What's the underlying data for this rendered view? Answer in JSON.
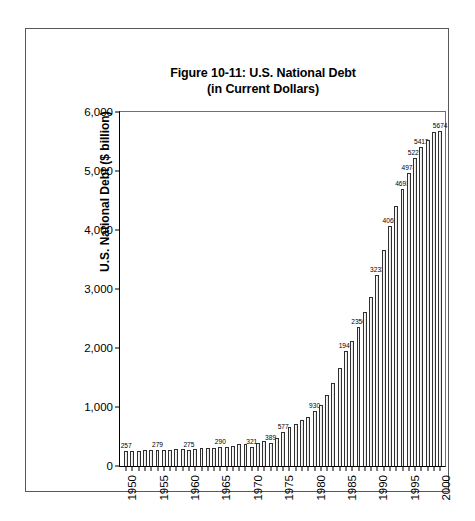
{
  "figure": {
    "title_line1": "Figure 10-11: U.S. National Debt",
    "title_line2": "(in Current Dollars)"
  },
  "chart_data": {
    "type": "bar",
    "title": "Figure 10-11: U.S. National Debt (in Current Dollars)",
    "xlabel": "",
    "ylabel": "U.S. National Debt ($ billion)",
    "ylim": [
      0,
      6000
    ],
    "y_ticks": [
      "0",
      "1,000",
      "2,000",
      "3,000",
      "4,000",
      "5,000",
      "6,000"
    ],
    "y_tick_values": [
      0,
      1000,
      2000,
      3000,
      4000,
      5000,
      6000
    ],
    "x_tick_labels": [
      "1950",
      "1955",
      "1960",
      "1965",
      "1970",
      "1975",
      "1980",
      "1985",
      "1990",
      "1995",
      "2000"
    ],
    "grid": false,
    "legend": false,
    "categories": [
      "1950",
      "1951",
      "1952",
      "1953",
      "1954",
      "1955",
      "1956",
      "1957",
      "1958",
      "1959",
      "1960",
      "1961",
      "1962",
      "1963",
      "1964",
      "1965",
      "1966",
      "1967",
      "1968",
      "1969",
      "1970",
      "1971",
      "1972",
      "1973",
      "1974",
      "1975",
      "1976",
      "1977",
      "1978",
      "1979",
      "1980",
      "1981",
      "1982",
      "1983",
      "1984",
      "1985",
      "1986",
      "1987",
      "1988",
      "1989",
      "1990",
      "1991",
      "1992",
      "1993",
      "1994",
      "1995",
      "1996",
      "1997",
      "1998",
      "1999",
      "2000"
    ],
    "values": [
      257,
      255,
      259,
      266,
      271,
      279,
      273,
      272,
      280,
      288,
      275,
      289,
      298,
      306,
      312,
      321,
      329,
      341,
      370,
      367,
      321,
      398,
      427,
      389,
      483,
      577,
      654,
      718,
      776,
      829,
      930,
      1028,
      1197,
      1410,
      1663,
      1946,
      2125,
      2350,
      2602,
      2857,
      3233,
      3665,
      4065,
      4411,
      4693,
      4974,
      5225,
      5413,
      5526,
      5656,
      5674
    ],
    "point_labels": [
      {
        "category": "1950",
        "text": "257"
      },
      {
        "category": "1955",
        "text": "279"
      },
      {
        "category": "1960",
        "text": "275"
      },
      {
        "category": "1965",
        "text": "290"
      },
      {
        "category": "1970",
        "text": "321"
      },
      {
        "category": "1973",
        "text": "389"
      },
      {
        "category": "1975",
        "text": "577"
      },
      {
        "category": "1980",
        "text": "930"
      },
      {
        "category": "1985",
        "text": "1946"
      },
      {
        "category": "1987",
        "text": "2350"
      },
      {
        "category": "1990",
        "text": "3233"
      },
      {
        "category": "1992",
        "text": "4065"
      },
      {
        "category": "1994",
        "text": "4693"
      },
      {
        "category": "1995",
        "text": "4974"
      },
      {
        "category": "1996",
        "text": "5225"
      },
      {
        "category": "1997",
        "text": "5413"
      },
      {
        "category": "2000",
        "text": "5674"
      }
    ],
    "colors": {
      "bar_fill": "#f2f2f2",
      "bar_edge": "#2f2f2f",
      "axis": "#000000",
      "text": "#000000",
      "frame": "#58595b"
    }
  }
}
